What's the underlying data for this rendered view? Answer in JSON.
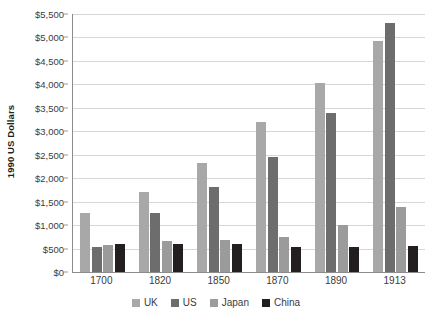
{
  "chart_data": {
    "type": "bar",
    "title": "",
    "subtitle": "",
    "xlabel": "",
    "ylabel": "1990 US Dollars",
    "categories": [
      "1700",
      "1820",
      "1850",
      "1870",
      "1890",
      "1913"
    ],
    "series": [
      {
        "name": "UK",
        "color": "#a8a8a8",
        "values": [
          1250,
          1710,
          2330,
          3190,
          4030,
          4920
        ]
      },
      {
        "name": "US",
        "color": "#6d6d6d",
        "values": [
          527,
          1257,
          1806,
          2445,
          3392,
          5301
        ]
      },
      {
        "name": "Japan",
        "color": "#9b9b9b",
        "values": [
          570,
          669,
          679,
          737,
          1012,
          1387
        ]
      },
      {
        "name": "China",
        "color": "#231f20",
        "values": [
          600,
          600,
          600,
          530,
          540,
          552
        ]
      }
    ],
    "ylim": [
      0,
      5500
    ],
    "ytick_step": 500,
    "ytick_labels": [
      "$0",
      "$500",
      "$1,000",
      "$1,500",
      "$2,000",
      "$2,500",
      "$3,000",
      "$3,500",
      "$4,000",
      "$4,500",
      "$5,000",
      "$5,500"
    ],
    "ytick_values": [
      0,
      500,
      1000,
      1500,
      2000,
      2500,
      3000,
      3500,
      4000,
      4500,
      5000,
      5500
    ],
    "grid": true,
    "grid_axis": "y",
    "legend_position": "bottom",
    "legend_entries": [
      "UK",
      "US",
      "Japan",
      "China"
    ],
    "background_color": "#ffffff",
    "axis_color": "#8c8c8c",
    "gridline_color": "#d7d7d7",
    "text_color": "#3b3b3b"
  }
}
